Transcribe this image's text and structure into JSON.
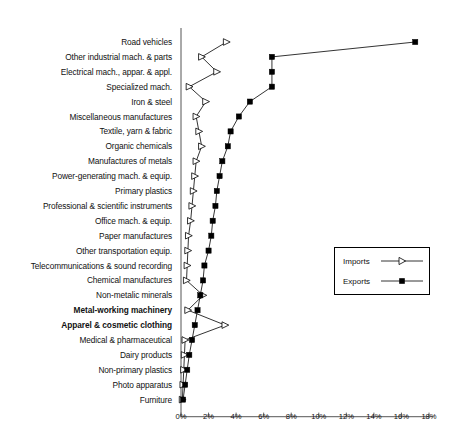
{
  "chart_data": {
    "type": "line",
    "title": "",
    "subtitle": "",
    "xlabel": "",
    "ylabel": "",
    "orientation": "horizontal",
    "xlim": [
      0,
      18
    ],
    "xunit": "%",
    "grid": false,
    "legend_position": "middle-right",
    "xticks": [
      0,
      2,
      4,
      6,
      8,
      10,
      12,
      14,
      16,
      18
    ],
    "xtick_labels": [
      "0%",
      "2%",
      "4%",
      "6%",
      "8%",
      "10%",
      "12%",
      "14%",
      "16%",
      "18%"
    ],
    "categories": [
      "Road vehicles",
      "Other industrial mach. & parts",
      "Electrical mach., appar. & appl.",
      "Specialized mach.",
      "Iron & steel",
      "Miscellaneous manufactures",
      "Textile, yarn & fabric",
      "Organic chemicals",
      "Manufactures of metals",
      "Power-generating mach. & equip.",
      "Primary plastics",
      "Professional & scientific instruments",
      "Office mach. & equip.",
      "Paper manufactures",
      "Other transportation equip.",
      "Telecommunications & sound recording",
      "Chemical manufactures",
      "Non-metalic minerals",
      "Metal-working machinery",
      "Apparel & cosmetic clothing",
      "Medical & pharmaceutical",
      "Dairy products",
      "Non-primary plastics",
      "Photo apparatus",
      "Furniture"
    ],
    "bold_categories": [
      "Metal-working machinery",
      "Apparel & cosmetic clothing"
    ],
    "series": [
      {
        "name": "Imports",
        "marker": "hollow-triangle",
        "color": "#000000",
        "values": [
          3.3,
          1.5,
          2.6,
          0.6,
          1.8,
          1.1,
          1.3,
          1.5,
          1.1,
          1.0,
          0.9,
          0.8,
          0.7,
          0.55,
          0.5,
          0.45,
          0.4,
          1.6,
          0.5,
          3.2,
          0.3,
          0.25,
          0.2,
          0.15,
          0.1
        ]
      },
      {
        "name": "Exports",
        "marker": "filled-square",
        "color": "#000000",
        "values": [
          17.0,
          6.6,
          6.6,
          6.6,
          5.0,
          4.2,
          3.6,
          3.4,
          3.0,
          2.8,
          2.6,
          2.5,
          2.3,
          2.2,
          2.0,
          1.7,
          1.6,
          1.4,
          1.2,
          1.0,
          0.8,
          0.6,
          0.45,
          0.3,
          0.15
        ]
      }
    ]
  },
  "legend": {
    "items": [
      {
        "label": "Imports"
      },
      {
        "label": "Exports"
      }
    ]
  }
}
